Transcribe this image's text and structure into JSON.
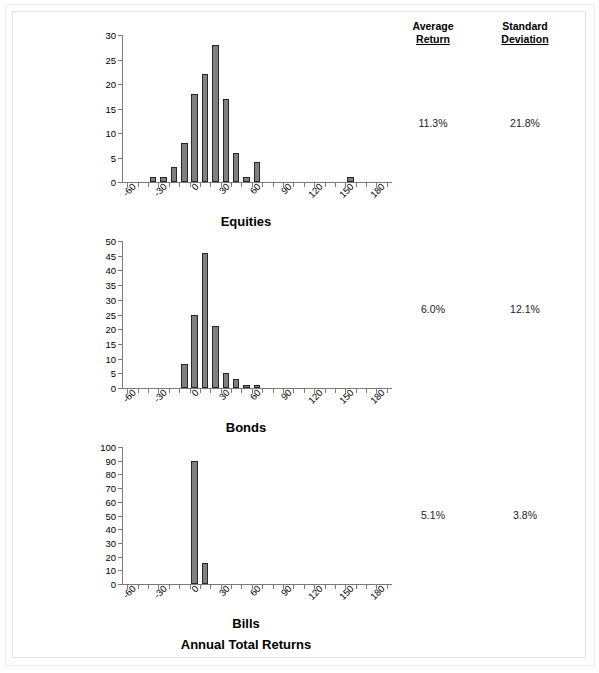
{
  "figure": {
    "title": "Annual Total Returns",
    "bar_color": "#808080",
    "bar_border_color": "#262626",
    "axis_color": "#7a7a7a"
  },
  "table": {
    "headers": {
      "average": {
        "line1": "Average",
        "line2": "Return"
      },
      "std": {
        "line1": "Standard",
        "line2": "Deviation"
      }
    },
    "rows": [
      {
        "name": "Equities",
        "average_return": "11.3%",
        "standard_deviation": "21.8%"
      },
      {
        "name": "Bonds",
        "average_return": "6.0%",
        "standard_deviation": "12.1%"
      },
      {
        "name": "Bills",
        "average_return": "5.1%",
        "standard_deviation": "3.8%"
      }
    ]
  },
  "chart_data": [
    {
      "type": "bar",
      "title": "Equities",
      "xlabel": "",
      "ylabel": "",
      "ylim": [
        0,
        30
      ],
      "yticks": [
        0,
        5,
        10,
        15,
        20,
        25,
        30
      ],
      "xlim": [
        -65,
        195
      ],
      "xticks": [
        -60,
        -30,
        0,
        30,
        60,
        90,
        120,
        150,
        180
      ],
      "xtick_step": 10,
      "grid": false,
      "legend": false,
      "bin_width": 10,
      "bins": [
        -60,
        -50,
        -40,
        -30,
        -20,
        -10,
        0,
        10,
        20,
        30,
        40,
        50,
        60,
        70,
        80,
        90,
        100,
        110,
        120,
        130,
        140,
        150,
        160,
        170,
        180,
        190
      ],
      "values": [
        0,
        0,
        1,
        1,
        3,
        8,
        18,
        22,
        28,
        17,
        6,
        1,
        4,
        0,
        0,
        0,
        0,
        0,
        0,
        0,
        0,
        1,
        0,
        0,
        0,
        0
      ]
    },
    {
      "type": "bar",
      "title": "Bonds",
      "xlabel": "",
      "ylabel": "",
      "ylim": [
        0,
        50
      ],
      "yticks": [
        0,
        5,
        10,
        15,
        20,
        25,
        30,
        35,
        40,
        45,
        50
      ],
      "xlim": [
        -65,
        195
      ],
      "xticks": [
        -60,
        -30,
        0,
        30,
        60,
        90,
        120,
        150,
        180
      ],
      "xtick_step": 10,
      "grid": false,
      "legend": false,
      "bin_width": 10,
      "bins": [
        -60,
        -50,
        -40,
        -30,
        -20,
        -10,
        0,
        10,
        20,
        30,
        40,
        50,
        60,
        70,
        80,
        90,
        100,
        110,
        120,
        130,
        140,
        150,
        160,
        170,
        180,
        190
      ],
      "values": [
        0,
        0,
        0,
        0,
        0,
        8,
        25,
        46,
        21,
        5,
        3,
        1,
        1,
        0,
        0,
        0,
        0,
        0,
        0,
        0,
        0,
        0,
        0,
        0,
        0,
        0
      ]
    },
    {
      "type": "bar",
      "title": "Bills",
      "xlabel": "",
      "ylabel": "",
      "ylim": [
        0,
        100
      ],
      "yticks": [
        0,
        10,
        20,
        30,
        40,
        50,
        60,
        70,
        80,
        90,
        100
      ],
      "xlim": [
        -65,
        195
      ],
      "xticks": [
        -60,
        -30,
        0,
        30,
        60,
        90,
        120,
        150,
        180
      ],
      "xtick_step": 10,
      "grid": false,
      "legend": false,
      "bin_width": 10,
      "bins": [
        -60,
        -50,
        -40,
        -30,
        -20,
        -10,
        0,
        10,
        20,
        30,
        40,
        50,
        60,
        70,
        80,
        90,
        100,
        110,
        120,
        130,
        140,
        150,
        160,
        170,
        180,
        190
      ],
      "values": [
        0,
        0,
        0,
        0,
        0,
        0,
        90,
        15,
        0,
        0,
        0,
        0,
        0,
        0,
        0,
        0,
        0,
        0,
        0,
        0,
        0,
        0,
        0,
        0,
        0,
        0
      ]
    }
  ]
}
